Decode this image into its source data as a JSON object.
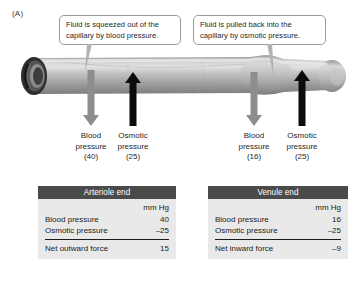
{
  "panel": {
    "label": "(A)"
  },
  "callouts": [
    {
      "name": "callout-blood-pressure",
      "line1": "Fluid is squeezed out of the",
      "line2": "capillary by blood pressure."
    },
    {
      "name": "callout-osmotic-pressure",
      "line1": "Fluid is pulled back into the",
      "line2": "capillary by osmotic pressure."
    }
  ],
  "pressures": [
    {
      "name": "blood-pressure-arteriole",
      "line1": "Blood",
      "line2": "pressure",
      "value": "(40)",
      "arrow": "down-arrow-icon",
      "color": "#8d8d8d"
    },
    {
      "name": "osmotic-pressure-arteriole",
      "line1": "Osmotic",
      "line2": "pressure",
      "value": "(25)",
      "arrow": "up-arrow-icon",
      "color": "#0b0b0b"
    },
    {
      "name": "blood-pressure-venule",
      "line1": "Blood",
      "line2": "pressure",
      "value": "(16)",
      "arrow": "down-arrow-icon",
      "color": "#8d8d8d"
    },
    {
      "name": "osmotic-pressure-venule",
      "line1": "Osmotic",
      "line2": "pressure",
      "value": "(25)",
      "arrow": "up-arrow-icon",
      "color": "#0b0b0b"
    }
  ],
  "tables": [
    {
      "name": "table-arteriole-end",
      "title": "Arteriole end",
      "unit": "mm Hg",
      "rows": [
        {
          "label": "Blood pressure",
          "value": "40"
        },
        {
          "label": "Osmotic pressure",
          "value": "–25"
        }
      ],
      "net": {
        "label": "Net outward force",
        "value": "15"
      }
    },
    {
      "name": "table-venule-end",
      "title": "Venule end",
      "unit": "mm Hg",
      "rows": [
        {
          "label": "Blood pressure",
          "value": "16"
        },
        {
          "label": "Osmotic pressure",
          "value": "–25"
        }
      ],
      "net": {
        "label": "Net inward force",
        "value": "–9"
      }
    }
  ],
  "vessel": {
    "name": "capillary-vessel",
    "description": "capillary tube with open lumen at left end"
  },
  "colors": {
    "header_bar": "#4a4a4a",
    "table_body": "#e9e9e9",
    "gray_arrow": "#8d8d8d",
    "black_arrow": "#0b0b0b"
  }
}
